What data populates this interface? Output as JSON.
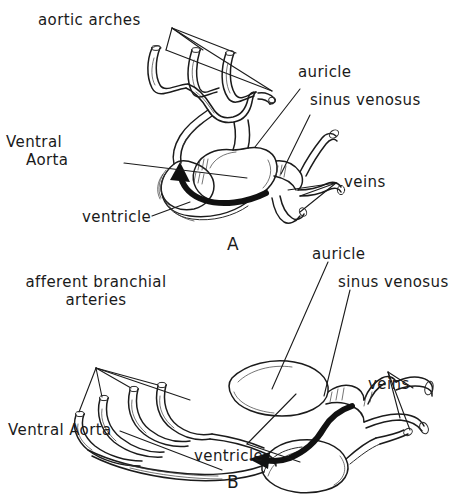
{
  "figure": {
    "background_color": "#ffffff",
    "ink_color": "#1b1b1b",
    "style": "hand-drawn line illustration"
  },
  "panels": [
    {
      "id": "A",
      "letter": "A",
      "caption": "A",
      "description": "compact S-shaped fish heart with aortic arches",
      "labels": {
        "aortic_arches": "aortic arches",
        "ventral_line1": "Ventral",
        "ventral_line2": "Aorta",
        "ventricle": "ventricle",
        "auricle": "auricle",
        "sinus_venosus": "sinus venosus",
        "veins": "veins"
      }
    },
    {
      "id": "B",
      "letter": "B",
      "caption": "B",
      "description": "elongated fish heart with afferent branchial arteries",
      "labels": {
        "afferent_line1": "afferent branchial",
        "afferent_line2": "arteries",
        "ventral_aorta": "Ventral Aorta",
        "ventricle": "ventricle",
        "auricle": "auricle",
        "sinus_venosus": "sinus venosus",
        "veins": "veins"
      }
    }
  ]
}
